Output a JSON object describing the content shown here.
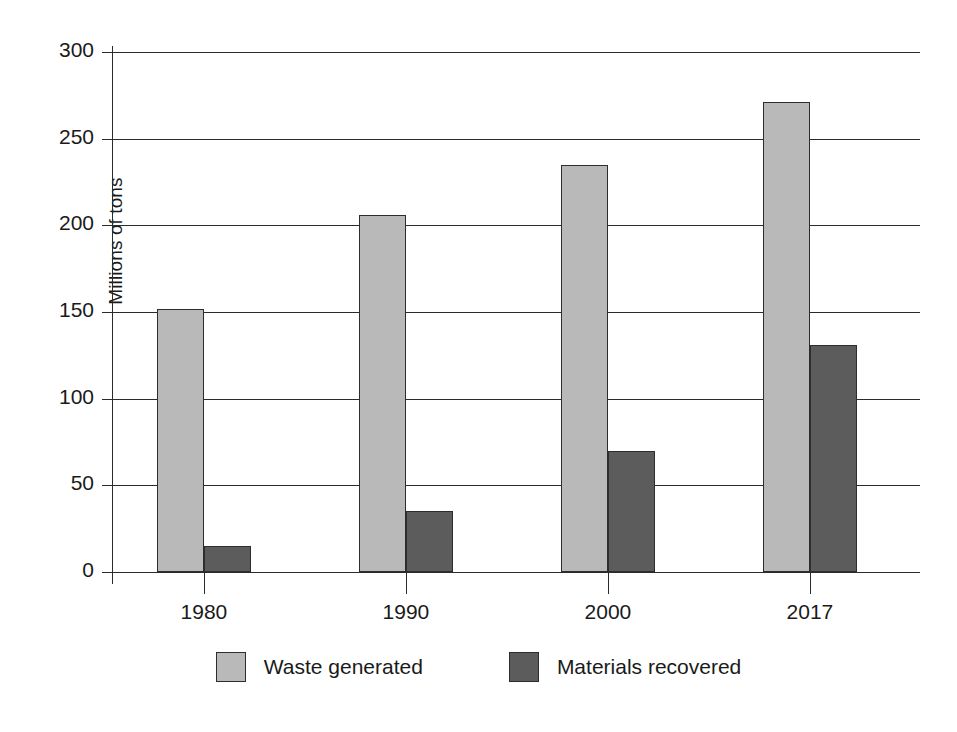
{
  "chart_data": {
    "type": "bar",
    "title": "",
    "xlabel": "",
    "ylabel": "Millions of tons",
    "categories": [
      "1980",
      "1990",
      "2000",
      "2017"
    ],
    "series": [
      {
        "name": "Waste generated",
        "color": "#b9b9b9",
        "values": [
          152,
          206,
          235,
          271
        ]
      },
      {
        "name": "Materials recovered",
        "color": "#5c5c5c",
        "values": [
          15,
          35,
          70,
          131
        ]
      }
    ],
    "ylim": [
      0,
      300
    ],
    "ytick_labels": [
      "300",
      "250",
      "200",
      "150",
      "100",
      "50",
      "0"
    ],
    "ytick_values": [
      300,
      250,
      200,
      150,
      100,
      50,
      0
    ],
    "grid": "horizontal",
    "legend_position": "bottom-center"
  },
  "axis": {
    "y_title": "Millions of tons"
  },
  "legend": {
    "items": [
      {
        "label": "Waste generated"
      },
      {
        "label": "Materials recovered"
      }
    ]
  },
  "colors": {
    "waste_generated": "#b9b9b9",
    "materials_recovered": "#5c5c5c",
    "axis": "#2b2b2b",
    "background": "#ffffff"
  }
}
